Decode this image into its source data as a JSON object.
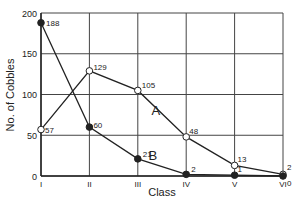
{
  "chart_data": {
    "type": "line",
    "title": "",
    "xlabel": "Class",
    "ylabel": "No. of Cobbles",
    "categories": [
      "I",
      "II",
      "III",
      "IV",
      "V",
      "VI"
    ],
    "ylim": [
      0,
      200
    ],
    "yticks": [
      0,
      50,
      100,
      150,
      200
    ],
    "grid": true,
    "legend": "inline labels",
    "series": [
      {
        "name": "A",
        "marker": "open-circle",
        "values": [
          57,
          129,
          105,
          48,
          13,
          2
        ]
      },
      {
        "name": "B",
        "marker": "filled-circle",
        "values": [
          188,
          60,
          21,
          2,
          1,
          0
        ]
      }
    ],
    "colors": {
      "line": "#222222",
      "grid": "#444444",
      "background": "#ffffff"
    }
  }
}
